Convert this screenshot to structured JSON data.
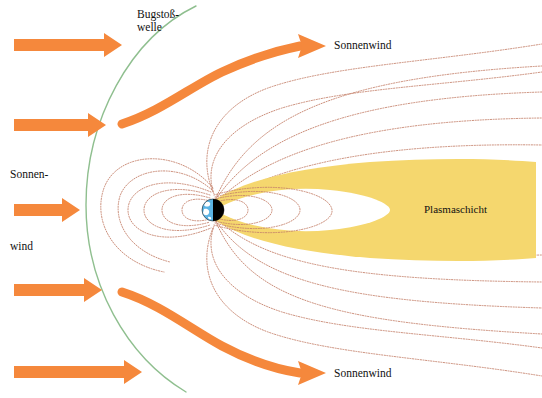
{
  "figure": {
    "kind": "magnetosphere-diagram",
    "language": "de",
    "width": 542,
    "height": 398,
    "background_color": "#ffffff"
  },
  "labels": {
    "bow_shock_line1": "Bugstoß-",
    "bow_shock_line2": "welle",
    "solar_wind_left_line1": "Sonnen-",
    "solar_wind_left_line2": "wind",
    "solar_wind_top": "Sonnenwind",
    "solar_wind_bottom": "Sonnenwind",
    "plasma_sheet": "Plasmaschicht"
  },
  "colors": {
    "arrow_orange": "#F5883C",
    "bow_shock_green": "#8FBF8F",
    "plasma_yellow": "#F5D76E",
    "field_line_brown": "#C4806A",
    "earth_day": "#5BB4E5",
    "earth_night": "#000000",
    "earth_land": "#FFFFFF",
    "text": "#111111"
  },
  "geometry": {
    "earth": {
      "cx": 213,
      "cy": 210,
      "r": 11
    },
    "bow_shock": {
      "apex_x": 86,
      "apex_y": 205
    },
    "inflow_arrows": [
      {
        "y": 45,
        "x_start": 14,
        "x_end": 120,
        "thick": 11
      },
      {
        "y": 125,
        "x_start": 14,
        "x_end": 105,
        "thick": 11
      },
      {
        "y": 210,
        "x_start": 14,
        "x_end": 80,
        "thick": 11
      },
      {
        "y": 290,
        "x_start": 14,
        "x_end": 100,
        "thick": 11
      },
      {
        "y": 372,
        "x_start": 14,
        "x_end": 140,
        "thick": 11
      }
    ],
    "deflected_arrows": [
      {
        "id": "upper",
        "start_x": 120,
        "start_y": 120,
        "end_x": 310,
        "end_y": 44
      },
      {
        "id": "lower",
        "start_x": 120,
        "start_y": 295,
        "end_x": 310,
        "end_y": 375
      }
    ],
    "field_line_count": 14,
    "plasma_sheet_extent_x": [
      228,
      536
    ]
  }
}
